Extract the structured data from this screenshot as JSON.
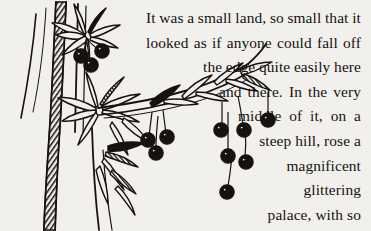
{
  "page": {
    "background_color": "#f2f0ec",
    "ink_color": "#15120f",
    "width": 371,
    "height": 231
  },
  "passage": {
    "full_text": "It was a small land, so small that it looked as if anyone could fall off the edge quite easily here and there. In the very middle of it, on a steep hill, rose a magnificent glittering palace, with so many thousands",
    "alignment": "right",
    "lines": [
      {
        "id": "line-1",
        "text": "It was a small land, so small that it",
        "justified": true,
        "words": [
          "It",
          "was",
          "a",
          "small",
          "land,",
          "so",
          "small",
          "that",
          "it"
        ]
      },
      {
        "id": "line-2",
        "text": "looked as if anyone could fall off",
        "justified": true,
        "words": [
          "looked",
          "as",
          "if",
          "anyone",
          "could",
          "fall",
          "off"
        ]
      },
      {
        "id": "line-3",
        "text": "the edge quite easily here",
        "justified": true,
        "words": [
          "the",
          "edge",
          "quite",
          "easily",
          "here"
        ]
      },
      {
        "id": "line-4",
        "text": "and there. In the very",
        "justified": true,
        "words": [
          "and",
          "there.",
          "In",
          "the",
          "very"
        ]
      },
      {
        "id": "line-5",
        "text": "middle of it, on a",
        "justified": true,
        "words": [
          "middle",
          "of",
          "it,",
          "on",
          "a"
        ]
      },
      {
        "id": "line-6",
        "text": "steep hill, rose a",
        "justified": false,
        "words": []
      },
      {
        "id": "line-7",
        "text": "magnificent",
        "justified": false,
        "words": []
      },
      {
        "id": "line-8",
        "text": "glittering",
        "justified": false,
        "words": []
      },
      {
        "id": "line-9",
        "text": "palace, with so",
        "justified": false,
        "words": []
      },
      {
        "id": "line-10",
        "text": "many thousands",
        "justified": true,
        "words": [
          "many",
          "thousands"
        ]
      }
    ]
  },
  "illustration": {
    "name": "berry-branch-pen-and-ink-drawing",
    "description": "Pen and ink drawing of a berry branch with leaf whorls, hatched stems and round black berries",
    "elements": [
      "vertical-stem-left",
      "vertical-stem-hatched",
      "upper-leaf-whorl",
      "upper-berry-cluster",
      "middle-leaf-whorl",
      "diagonal-branch",
      "lower-berry-cluster",
      "lower-leaf-spray"
    ]
  }
}
